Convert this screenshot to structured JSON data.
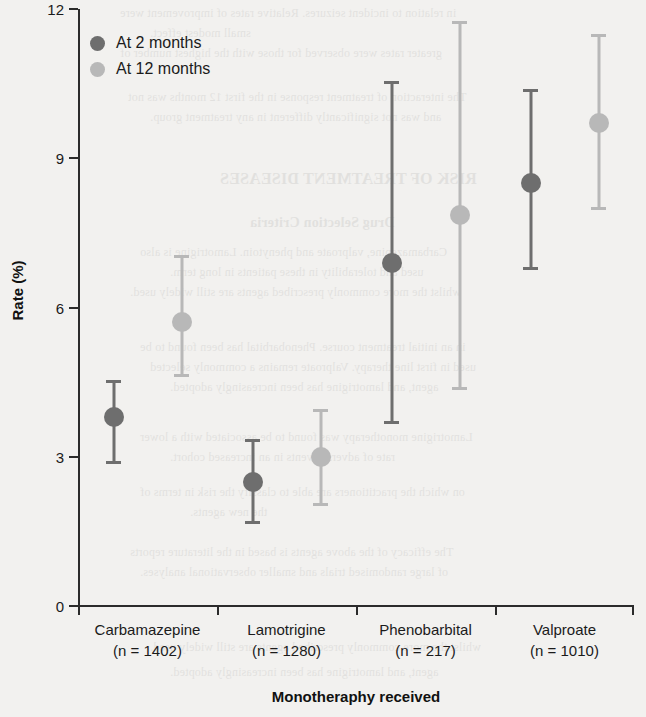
{
  "chart_data": {
    "type": "scatter",
    "title": "",
    "xlabel": "Monotheraphy received",
    "ylabel": "Rate (%)",
    "ylim": [
      0,
      12
    ],
    "yticks": [
      0,
      3,
      6,
      9,
      12
    ],
    "grid": false,
    "legend_position": "top-left",
    "categories": [
      "Carbamazepine",
      "Lamotrigine",
      "Phenobarbital",
      "Valproate"
    ],
    "category_sublabels": [
      "(n = 1402)",
      "(n = 1280)",
      "(n = 217)",
      "(n = 1010)"
    ],
    "category_n": [
      1402,
      1280,
      217,
      1010
    ],
    "series": [
      {
        "name": "At 2 months",
        "color": "#6e6e6e",
        "values": [
          3.8,
          2.5,
          6.9,
          8.5
        ],
        "ci_low": [
          2.85,
          1.65,
          3.65,
          6.75
        ],
        "ci_high": [
          4.55,
          3.35,
          10.55,
          10.4
        ]
      },
      {
        "name": "At 12 months",
        "color": "#b8b8b8",
        "values": [
          5.7,
          3.0,
          7.85,
          9.7
        ],
        "ci_low": [
          4.6,
          2.0,
          4.35,
          7.95
        ],
        "ci_high": [
          7.05,
          3.95,
          11.75,
          11.5
        ]
      }
    ]
  },
  "legend": {
    "items": [
      {
        "label": "At 2 months",
        "color": "#6e6e6e"
      },
      {
        "label": "At 12 months",
        "color": "#b8b8b8"
      }
    ]
  },
  "axes": {
    "y_title": "Rate (%)",
    "x_title": "Monotheraphy received",
    "y_tick_labels": [
      "12",
      "9",
      "6",
      "3",
      "0"
    ]
  },
  "background_text": {
    "lines": [
      "in relation to incident seizures. Relative rates of improvement were",
      "small modest effect.",
      "greater rates were observed for those with the highest number of",
      "The interaction of treatment response in the first 12 months was not",
      "and was not significantly different in any treatment group."
    ],
    "heading": "RISK OF TREATMENT DISEASES",
    "subheading": "Drug Selection Criteria",
    "paragraphs": [
      "Carbamazepine, valproate and phenytoin. Lamotrigine is also",
      "used and tolerability in these patients in long term.",
      "whilst the more commonly prescribed agents are still widely used.",
      "in an initial treatment course. Phenobarbital has been found to be",
      "used in first line therapy. Valproate remains a commonly selected",
      "agent, and lamotrigine has been increasingly adopted.",
      "Lamotrigine monotherapy was found to be associated with a lower",
      "rate of adverse events in an increased cohort.",
      "on which the practitioners are able to classify the risk in terms of",
      "the new agents.",
      "The efficacy of the above agents is based in the literature reports",
      "of large randomised trials and smaller observational analyses."
    ]
  }
}
